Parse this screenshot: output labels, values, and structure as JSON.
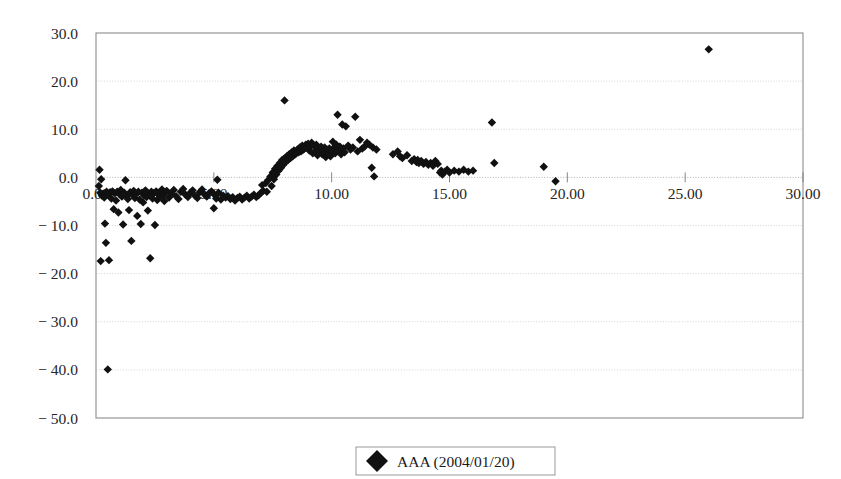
{
  "chart_data": {
    "type": "scatter",
    "title": "",
    "subtitle": "",
    "xlabel": "",
    "ylabel": "",
    "xlim": [
      0,
      30
    ],
    "ylim": [
      -50,
      30
    ],
    "xticks": [
      0,
      5,
      10,
      15,
      20,
      25,
      30
    ],
    "yticks": [
      30,
      20,
      10,
      0,
      -10,
      -20,
      -30,
      -40,
      -50
    ],
    "xtick_labels": [
      "0.00",
      "5.00",
      "10.00",
      "15.00",
      "20.00",
      "25.00",
      "30.00"
    ],
    "ytick_labels": [
      "30.0",
      "20.0",
      "10.0",
      "0.0",
      "-10.0",
      "-20.0",
      "-30.0",
      "-40.0",
      "-50.0"
    ],
    "grid": true,
    "grid_axis": "y",
    "legend_position": "bottom-center",
    "marker_shape": "diamond",
    "marker_color": "#111111",
    "marker_size": 4.2,
    "series": [
      {
        "name": "AAA (2004/01/20)",
        "points": [
          [
            0.12,
            -1.8
          ],
          [
            0.15,
            1.6
          ],
          [
            0.18,
            -3.2
          ],
          [
            0.2,
            -17.4
          ],
          [
            0.22,
            -0.4
          ],
          [
            0.25,
            -3.8
          ],
          [
            0.3,
            -3.4
          ],
          [
            0.35,
            -4.2
          ],
          [
            0.38,
            -9.6
          ],
          [
            0.42,
            -13.6
          ],
          [
            0.45,
            -3.0
          ],
          [
            0.5,
            -39.9
          ],
          [
            0.52,
            -3.6
          ],
          [
            0.55,
            -17.2
          ],
          [
            0.6,
            -3.1
          ],
          [
            0.65,
            -4.4
          ],
          [
            0.7,
            -2.9
          ],
          [
            0.75,
            -6.6
          ],
          [
            0.8,
            -3.3
          ],
          [
            0.85,
            -4.8
          ],
          [
            0.9,
            -3.0
          ],
          [
            0.95,
            -7.3
          ],
          [
            1.0,
            -3.5
          ],
          [
            1.05,
            -2.6
          ],
          [
            1.1,
            -4.0
          ],
          [
            1.15,
            -9.8
          ],
          [
            1.2,
            -3.2
          ],
          [
            1.25,
            -0.6
          ],
          [
            1.3,
            -3.9
          ],
          [
            1.35,
            -4.5
          ],
          [
            1.4,
            -6.8
          ],
          [
            1.45,
            -3.1
          ],
          [
            1.5,
            -13.2
          ],
          [
            1.55,
            -3.6
          ],
          [
            1.6,
            -2.8
          ],
          [
            1.65,
            -4.3
          ],
          [
            1.7,
            -3.4
          ],
          [
            1.75,
            -8.0
          ],
          [
            1.8,
            -3.0
          ],
          [
            1.85,
            -4.6
          ],
          [
            1.9,
            -9.7
          ],
          [
            1.95,
            -3.2
          ],
          [
            2.0,
            -5.2
          ],
          [
            2.05,
            -3.8
          ],
          [
            2.1,
            -2.7
          ],
          [
            2.15,
            -4.1
          ],
          [
            2.2,
            -6.9
          ],
          [
            2.25,
            -3.5
          ],
          [
            2.3,
            -16.8
          ],
          [
            2.35,
            -3.0
          ],
          [
            2.4,
            -4.4
          ],
          [
            2.45,
            -3.3
          ],
          [
            2.5,
            -9.9
          ],
          [
            2.55,
            -2.9
          ],
          [
            2.6,
            -4.7
          ],
          [
            2.65,
            -3.6
          ],
          [
            2.7,
            -3.1
          ],
          [
            2.75,
            -4.0
          ],
          [
            2.8,
            -2.5
          ],
          [
            2.85,
            -3.7
          ],
          [
            2.9,
            -4.9
          ],
          [
            2.95,
            -3.2
          ],
          [
            3.0,
            -2.8
          ],
          [
            3.1,
            -4.2
          ],
          [
            3.2,
            -3.4
          ],
          [
            3.3,
            -2.6
          ],
          [
            3.4,
            -3.9
          ],
          [
            3.5,
            -4.5
          ],
          [
            3.6,
            -3.0
          ],
          [
            3.7,
            -2.4
          ],
          [
            3.8,
            -3.6
          ],
          [
            3.9,
            -4.1
          ],
          [
            4.0,
            -3.2
          ],
          [
            4.1,
            -2.7
          ],
          [
            4.2,
            -3.8
          ],
          [
            4.3,
            -4.3
          ],
          [
            4.4,
            -3.1
          ],
          [
            4.5,
            -2.5
          ],
          [
            4.6,
            -3.5
          ],
          [
            4.7,
            -4.0
          ],
          [
            4.8,
            -3.3
          ],
          [
            4.9,
            -2.9
          ],
          [
            5.0,
            -6.4
          ],
          [
            5.05,
            -3.7
          ],
          [
            5.1,
            -4.4
          ],
          [
            5.15,
            -0.5
          ],
          [
            5.2,
            -3.2
          ],
          [
            5.3,
            -4.6
          ],
          [
            5.4,
            -3.8
          ],
          [
            5.5,
            -4.2
          ],
          [
            5.6,
            -3.9
          ],
          [
            5.7,
            -4.5
          ],
          [
            5.8,
            -4.1
          ],
          [
            5.9,
            -4.8
          ],
          [
            6.0,
            -4.3
          ],
          [
            6.1,
            -4.0
          ],
          [
            6.2,
            -4.6
          ],
          [
            6.3,
            -4.2
          ],
          [
            6.4,
            -3.8
          ],
          [
            6.5,
            -4.4
          ],
          [
            6.6,
            -4.0
          ],
          [
            6.7,
            -3.6
          ],
          [
            6.8,
            -4.1
          ],
          [
            6.9,
            -3.7
          ],
          [
            7.0,
            -3.2
          ],
          [
            7.05,
            -1.6
          ],
          [
            7.1,
            -2.8
          ],
          [
            7.2,
            -1.2
          ],
          [
            7.25,
            -3.0
          ],
          [
            7.3,
            -0.6
          ],
          [
            7.4,
            0.2
          ],
          [
            7.45,
            -1.8
          ],
          [
            7.5,
            1.0
          ],
          [
            7.55,
            -0.4
          ],
          [
            7.6,
            1.8
          ],
          [
            7.65,
            0.6
          ],
          [
            7.7,
            2.4
          ],
          [
            7.75,
            1.4
          ],
          [
            7.8,
            3.0
          ],
          [
            7.85,
            2.0
          ],
          [
            7.9,
            3.6
          ],
          [
            7.95,
            2.6
          ],
          [
            8.0,
            4.0
          ],
          [
            8.05,
            3.2
          ],
          [
            8.1,
            4.4
          ],
          [
            8.15,
            3.6
          ],
          [
            8.2,
            4.8
          ],
          [
            8.25,
            4.0
          ],
          [
            8.3,
            5.2
          ],
          [
            8.35,
            4.4
          ],
          [
            8.4,
            5.6
          ],
          [
            8.45,
            4.8
          ],
          [
            8.5,
            5.0
          ],
          [
            8.55,
            5.8
          ],
          [
            8.6,
            5.2
          ],
          [
            8.65,
            6.2
          ],
          [
            8.7,
            5.4
          ],
          [
            8.75,
            6.6
          ],
          [
            8.8,
            5.8
          ],
          [
            8.85,
            6.0
          ],
          [
            8.9,
            6.8
          ],
          [
            8.95,
            6.2
          ],
          [
            9.0,
            7.0
          ],
          [
            9.05,
            5.6
          ],
          [
            9.1,
            6.4
          ],
          [
            9.15,
            7.2
          ],
          [
            9.2,
            5.0
          ],
          [
            9.25,
            6.6
          ],
          [
            9.3,
            5.4
          ],
          [
            9.35,
            6.8
          ],
          [
            9.4,
            4.6
          ],
          [
            9.45,
            6.0
          ],
          [
            9.5,
            5.2
          ],
          [
            9.55,
            6.4
          ],
          [
            9.6,
            4.8
          ],
          [
            9.65,
            5.6
          ],
          [
            9.7,
            6.2
          ],
          [
            9.75,
            4.2
          ],
          [
            9.8,
            5.8
          ],
          [
            9.85,
            5.0
          ],
          [
            9.9,
            6.0
          ],
          [
            9.95,
            4.4
          ],
          [
            10.0,
            5.4
          ],
          [
            10.05,
            7.4
          ],
          [
            10.1,
            6.2
          ],
          [
            10.15,
            5.0
          ],
          [
            10.2,
            6.8
          ],
          [
            10.25,
            13.0
          ],
          [
            10.3,
            5.6
          ],
          [
            10.35,
            6.4
          ],
          [
            10.4,
            4.8
          ],
          [
            10.45,
            11.0
          ],
          [
            10.5,
            6.0
          ],
          [
            10.55,
            5.2
          ],
          [
            10.6,
            10.6
          ],
          [
            10.7,
            6.6
          ],
          [
            10.8,
            5.8
          ],
          [
            10.9,
            6.2
          ],
          [
            11.0,
            12.6
          ],
          [
            11.1,
            5.4
          ],
          [
            11.2,
            7.8
          ],
          [
            11.3,
            6.0
          ],
          [
            11.4,
            6.4
          ],
          [
            11.5,
            7.2
          ],
          [
            11.6,
            6.8
          ],
          [
            11.7,
            2.0
          ],
          [
            11.75,
            6.2
          ],
          [
            11.8,
            0.2
          ],
          [
            11.9,
            5.8
          ],
          [
            8.0,
            16.0
          ],
          [
            12.6,
            4.8
          ],
          [
            12.8,
            5.4
          ],
          [
            12.9,
            4.4
          ],
          [
            13.0,
            4.0
          ],
          [
            13.2,
            4.6
          ],
          [
            13.4,
            3.4
          ],
          [
            13.5,
            3.8
          ],
          [
            13.6,
            3.2
          ],
          [
            13.65,
            3.6
          ],
          [
            13.7,
            3.0
          ],
          [
            13.8,
            3.4
          ],
          [
            13.9,
            2.8
          ],
          [
            14.0,
            3.2
          ],
          [
            14.1,
            2.6
          ],
          [
            14.2,
            3.0
          ],
          [
            14.3,
            2.4
          ],
          [
            14.4,
            3.4
          ],
          [
            14.5,
            2.8
          ],
          [
            14.6,
            1.0
          ],
          [
            14.65,
            1.4
          ],
          [
            14.7,
            0.6
          ],
          [
            14.8,
            1.2
          ],
          [
            14.9,
            1.6
          ],
          [
            15.0,
            1.0
          ],
          [
            15.2,
            1.4
          ],
          [
            15.4,
            1.2
          ],
          [
            15.6,
            1.6
          ],
          [
            15.8,
            1.2
          ],
          [
            16.0,
            1.4
          ],
          [
            16.8,
            11.4
          ],
          [
            16.9,
            3.0
          ],
          [
            19.0,
            2.2
          ],
          [
            19.5,
            -0.8
          ],
          [
            26.0,
            26.6
          ]
        ]
      }
    ]
  },
  "legend": {
    "entries": [
      {
        "label": "AAA (2004/01/20)",
        "marker": "diamond-marker",
        "color": "#111111"
      }
    ]
  },
  "axes": {
    "x_axis_name": "x-axis",
    "y_axis_name": "y-axis"
  }
}
